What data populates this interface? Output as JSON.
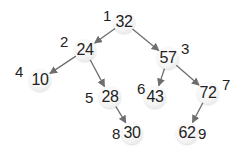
{
  "tree": {
    "nodes": [
      {
        "id": "n1",
        "index": "1",
        "value": "32",
        "x": 124,
        "y": 22,
        "lx": 103,
        "ly": 7
      },
      {
        "id": "n2",
        "index": "2",
        "value": "24",
        "x": 85,
        "y": 50,
        "lx": 60,
        "ly": 33
      },
      {
        "id": "n3",
        "index": "3",
        "value": "57",
        "x": 168,
        "y": 58,
        "lx": 181,
        "ly": 40
      },
      {
        "id": "n4",
        "index": "4",
        "value": "10",
        "x": 40,
        "y": 80,
        "lx": 15,
        "ly": 63
      },
      {
        "id": "n5",
        "index": "5",
        "value": "28",
        "x": 110,
        "y": 97,
        "lx": 85,
        "ly": 89
      },
      {
        "id": "n6",
        "index": "6",
        "value": "43",
        "x": 155,
        "y": 97,
        "lx": 137,
        "ly": 80
      },
      {
        "id": "n7",
        "index": "7",
        "value": "72",
        "x": 208,
        "y": 93,
        "lx": 222,
        "ly": 76
      },
      {
        "id": "n8",
        "index": "8",
        "value": "30",
        "x": 132,
        "y": 133,
        "lx": 112,
        "ly": 125
      },
      {
        "id": "n9",
        "index": "9",
        "value": "62",
        "x": 187,
        "y": 133,
        "lx": 198,
        "ly": 125
      }
    ],
    "edges": [
      [
        "n1",
        "n2"
      ],
      [
        "n1",
        "n3"
      ],
      [
        "n2",
        "n4"
      ],
      [
        "n2",
        "n5"
      ],
      [
        "n3",
        "n6"
      ],
      [
        "n3",
        "n7"
      ],
      [
        "n5",
        "n8"
      ],
      [
        "n7",
        "n9"
      ]
    ],
    "edge_color": "#6e6e6e"
  }
}
